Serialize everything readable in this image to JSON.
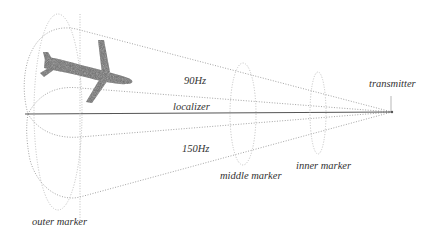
{
  "diagram": {
    "labels": {
      "upper_lobe": "90Hz",
      "lower_lobe": "150Hz",
      "beam": "localizer",
      "source": "transmitter",
      "outer": "outer marker",
      "middle": "middle marker",
      "inner": "inner marker"
    },
    "colors": {
      "line": "#555555",
      "dotted": "#9a9a9a",
      "airplane": "#6a6a6a",
      "text": "#333333"
    }
  }
}
